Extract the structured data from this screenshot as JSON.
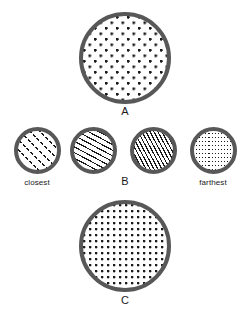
{
  "figure": {
    "background_color": "#ffffff",
    "ring_color": "#585858",
    "mark_color": "#1a1a1a",
    "canvas": {
      "width": 250,
      "height": 316
    }
  },
  "panels": [
    {
      "id": "panel-a",
      "label": "A",
      "texture": "sparse-dots",
      "texture_description": "widely spaced dots in a staggered grid",
      "shape": "circle",
      "diameter": 92,
      "x": 79,
      "y": 12,
      "ring_width": 4,
      "dot_spacing": 11,
      "dot_size": 2.4,
      "label_x": 79,
      "label_y": 106,
      "label_width": 92
    },
    {
      "id": "panel-c",
      "label": "C",
      "texture": "dense-dots",
      "texture_description": "tightly spaced dots in a square grid",
      "shape": "circle",
      "diameter": 92,
      "x": 79,
      "y": 200,
      "ring_width": 4,
      "dot_spacing": 6,
      "dot_size": 2.2,
      "label_x": 79,
      "label_y": 295,
      "label_width": 92
    }
  ],
  "gradient_row": {
    "id": "panel-b",
    "label": "B",
    "label_x": 103,
    "label_y": 176,
    "label_width": 44,
    "left_caption": "closest",
    "left_caption_x": 0,
    "left_caption_width": 74,
    "left_caption_y": 179,
    "right_caption": "farthest",
    "right_caption_x": 176,
    "right_caption_width": 74,
    "right_caption_y": 179,
    "circles": [
      {
        "id": "grad-1",
        "texture": "dashed-diagonal-lines-coarse",
        "texture_description": "coarse dashed diagonal lines rising left to right",
        "x": 14,
        "y": 127,
        "diameter": 47,
        "ring_width": 4,
        "line_spacing": 7,
        "angle": 45
      },
      {
        "id": "grad-2",
        "texture": "solid-diagonal-lines-steep",
        "texture_description": "solid steep diagonal lines rising left to right",
        "x": 70,
        "y": 127,
        "diameter": 47,
        "ring_width": 4,
        "line_spacing": 5,
        "angle": 62
      },
      {
        "id": "grad-3",
        "texture": "solid-diagonal-lines-shallow",
        "texture_description": "solid shallow diagonal lines, more closely spaced",
        "x": 130,
        "y": 127,
        "diameter": 47,
        "ring_width": 4,
        "line_spacing": 3.5,
        "angle": 28
      },
      {
        "id": "grad-4",
        "texture": "vertical-dotted-lines",
        "texture_description": "fine vertical dotted lines, densest texture",
        "x": 190,
        "y": 127,
        "diameter": 47,
        "ring_width": 4,
        "line_spacing": 4,
        "angle": 90
      }
    ]
  }
}
